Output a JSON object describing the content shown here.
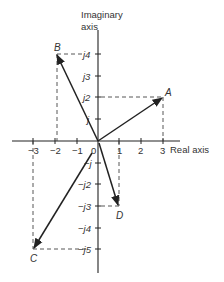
{
  "diagram": {
    "axes": {
      "imaginary_label_line1": "Imaginary",
      "imaginary_label_line2": "axis",
      "real_label": "Real axis"
    },
    "real_ticks": [
      "−3",
      "−2",
      "−1",
      "0",
      "1",
      "2",
      "3"
    ],
    "imag_ticks_pos": [
      "j",
      "j2",
      "j3",
      "j4"
    ],
    "imag_ticks_neg": [
      "−j",
      "−j2",
      "−j3",
      "−j4",
      "−j5"
    ],
    "points": [
      {
        "label": "A",
        "real": 3,
        "imag": 2
      },
      {
        "label": "B",
        "real": -2,
        "imag": 4
      },
      {
        "label": "C",
        "real": -3,
        "imag": -5
      },
      {
        "label": "D",
        "real": 1,
        "imag": -3
      }
    ],
    "colors": {
      "line": "#222222",
      "dash": "#444444",
      "text": "#333333"
    }
  }
}
